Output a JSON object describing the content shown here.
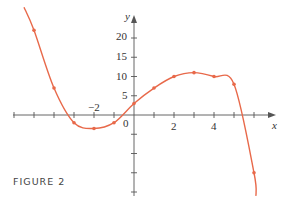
{
  "chart_data": {
    "type": "line",
    "title": "",
    "xlabel": "x",
    "ylabel": "y",
    "x": [
      -5,
      -4,
      -3,
      -2,
      -1,
      0,
      1,
      2,
      3,
      4,
      5,
      6
    ],
    "series": [
      {
        "name": "f(x)",
        "values": [
          22,
          7,
          -2,
          -3.5,
          -2,
          3,
          7,
          10,
          11,
          10,
          8,
          -15
        ]
      }
    ],
    "x_tick_labels": [
      "-2",
      "0",
      "2",
      "4"
    ],
    "y_tick_labels": [
      "5",
      "10",
      "15",
      "20"
    ],
    "xlim": [
      -6.5,
      7
    ],
    "ylim": [
      -24,
      25
    ],
    "grid": false,
    "line_color": "#e8694a"
  },
  "caption": "FIGURE 2"
}
